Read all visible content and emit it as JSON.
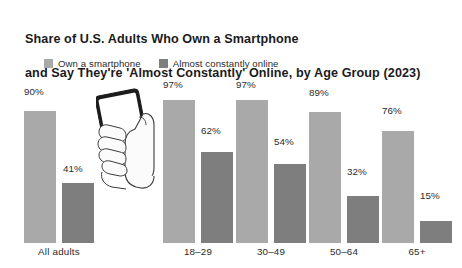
{
  "chart_data": {
    "type": "bar",
    "title": "Share of U.S. Adults Who Own a Smartphone and Say They're 'Almost Constantly' Online, by Age Group (2023)",
    "title_line_1": "Share of U.S. Adults Who Own a Smartphone",
    "title_line_2": "and Say They're 'Almost Constantly' Online, by Age Group (2023)",
    "xlabel": "",
    "ylabel": "",
    "ylim": [
      0,
      100
    ],
    "grid": false,
    "legend_position": "top-left",
    "categories": [
      "All adults",
      "18–29",
      "30–49",
      "50–64",
      "65+"
    ],
    "series": [
      {
        "name": "Own a smartphone",
        "color": "#a9a9a9",
        "values": [
          90,
          97,
          97,
          89,
          76
        ],
        "labels": [
          "90%",
          "97%",
          "97%",
          "89%",
          "76%"
        ]
      },
      {
        "name": "Almost constantly online",
        "color": "#7e7e7e",
        "values": [
          41,
          62,
          54,
          32,
          15
        ],
        "labels": [
          "41%",
          "62%",
          "54%",
          "32%",
          "15%"
        ]
      }
    ],
    "annotations": [
      "hand-holding-smartphone-illustration"
    ]
  },
  "legend": {
    "items": [
      {
        "label": "Own a smartphone",
        "color": "#a9a9a9"
      },
      {
        "label": "Almost constantly online",
        "color": "#7e7e7e"
      }
    ]
  },
  "bars": [
    {
      "group": "All adults",
      "series": "Own a smartphone",
      "label": "90%",
      "value": 90,
      "color": "#a9a9a9",
      "x": 24,
      "w": 32,
      "label_x": 24,
      "label_y": 86
    },
    {
      "group": "All adults",
      "series": "Almost constantly online",
      "label": "41%",
      "value": 41,
      "color": "#7e7e7e",
      "x": 62,
      "w": 32,
      "label_x": 63,
      "label_y": 163
    },
    {
      "group": "18–29",
      "series": "Own a smartphone",
      "label": "97%",
      "value": 97,
      "color": "#a9a9a9",
      "x": 163,
      "w": 32,
      "label_x": 163,
      "label_y": 79
    },
    {
      "group": "18–29",
      "series": "Almost constantly online",
      "label": "62%",
      "value": 62,
      "color": "#7e7e7e",
      "x": 201,
      "w": 32,
      "label_x": 201,
      "label_y": 125
    },
    {
      "group": "30–49",
      "series": "Own a smartphone",
      "label": "97%",
      "value": 97,
      "color": "#a9a9a9",
      "x": 236,
      "w": 32,
      "label_x": 236,
      "label_y": 79
    },
    {
      "group": "30–49",
      "series": "Almost constantly online",
      "label": "54%",
      "value": 54,
      "color": "#7e7e7e",
      "x": 274,
      "w": 32,
      "label_x": 274,
      "label_y": 136
    },
    {
      "group": "50–64",
      "series": "Own a smartphone",
      "label": "89%",
      "value": 89,
      "color": "#a9a9a9",
      "x": 309,
      "w": 32,
      "label_x": 309,
      "label_y": 87
    },
    {
      "group": "50–64",
      "series": "Almost constantly online",
      "label": "32%",
      "value": 32,
      "color": "#7e7e7e",
      "x": 347,
      "w": 32,
      "label_x": 347,
      "label_y": 166
    },
    {
      "group": "65+",
      "series": "Own a smartphone",
      "label": "76%",
      "value": 76,
      "color": "#a9a9a9",
      "x": 382,
      "w": 32,
      "label_x": 382,
      "label_y": 105
    },
    {
      "group": "65+",
      "series": "Almost constantly online",
      "label": "15%",
      "value": 15,
      "color": "#7e7e7e",
      "x": 420,
      "w": 32,
      "label_x": 420,
      "label_y": 190
    }
  ],
  "group_labels": [
    {
      "text": "All adults",
      "x": 24,
      "w": 70
    },
    {
      "text": "18–29",
      "x": 163,
      "w": 70
    },
    {
      "text": "30–49",
      "x": 236,
      "w": 70
    },
    {
      "text": "50–64",
      "x": 309,
      "w": 70
    },
    {
      "text": "65+",
      "x": 382,
      "w": 70
    }
  ],
  "colors": {
    "background": "#ffffff",
    "series_light": "#a9a9a9",
    "series_dark": "#7e7e7e",
    "text": "#1b1b1b"
  }
}
